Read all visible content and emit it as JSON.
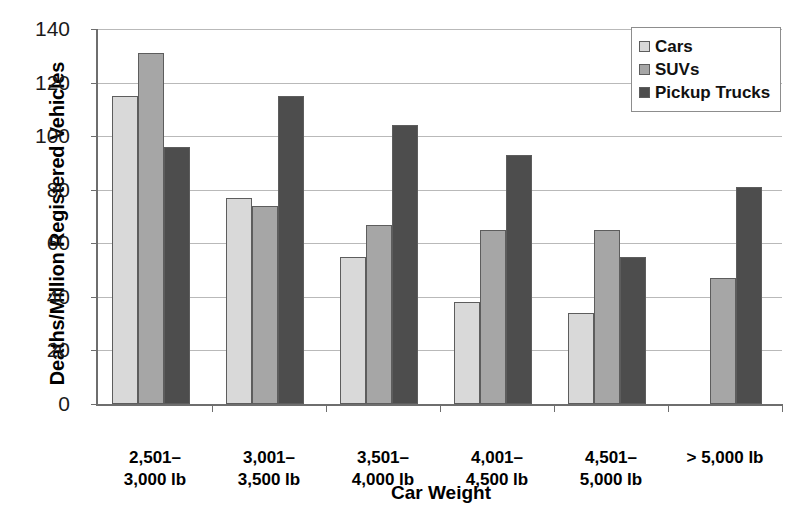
{
  "chart_data": {
    "type": "bar",
    "title": "",
    "xlabel": "Car Weight",
    "ylabel": "Deaths/Million Registered Vehicles",
    "categories": [
      "2,501–\n3,000 lb",
      "3,001–\n3,500 lb",
      "3,501–\n4,000 lb",
      "4,001–\n4,500 lb",
      "4,501–\n5,000 lb",
      "> 5,000 lb"
    ],
    "series": [
      {
        "name": "Cars",
        "color": "#d9d9d9",
        "values": [
          115,
          77,
          55,
          38,
          34,
          null
        ]
      },
      {
        "name": "SUVs",
        "color": "#a6a6a6",
        "values": [
          131,
          74,
          67,
          65,
          65,
          47
        ]
      },
      {
        "name": "Pickup Trucks",
        "color": "#4d4d4d",
        "values": [
          96,
          115,
          104,
          93,
          55,
          81
        ]
      }
    ],
    "ylim": [
      0,
      140
    ],
    "yticks": [
      0,
      20,
      40,
      60,
      80,
      100,
      120,
      140
    ],
    "grid": true,
    "legend_position": "top-right"
  }
}
